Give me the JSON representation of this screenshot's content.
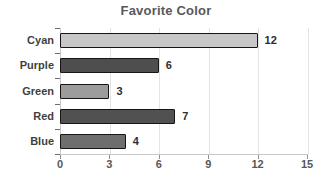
{
  "chart_data": {
    "type": "bar",
    "orientation": "horizontal",
    "title": "Favorite Color",
    "categories": [
      "Cyan",
      "Purple",
      "Green",
      "Red",
      "Blue"
    ],
    "values": [
      12,
      6,
      3,
      7,
      4
    ],
    "bar_colors": [
      "#c7c7c7",
      "#4e4e4e",
      "#9c9c9c",
      "#515151",
      "#6e6e6e"
    ],
    "bar_border_color": "#161616",
    "xlabel": "",
    "ylabel": "",
    "xlim": [
      0,
      15
    ],
    "x_ticks": [
      0,
      3,
      6,
      9,
      12,
      15
    ],
    "grid": true,
    "gridline_color": "#e3e3e3",
    "legend": "none",
    "value_labels": [
      12,
      6,
      3,
      7,
      4
    ],
    "title_color": "#58585a",
    "label_color": "#3f3f41",
    "tick_label_color": "#585858",
    "background_color": "#ffffff"
  }
}
